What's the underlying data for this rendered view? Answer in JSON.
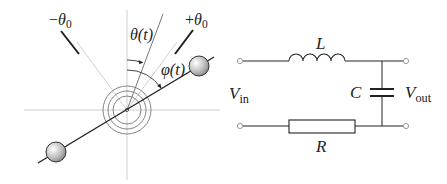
{
  "pendulum": {
    "labels": {
      "minus_theta0": {
        "sign": "−",
        "sym": "θ",
        "sub": "0"
      },
      "plus_theta0": {
        "sign": "+",
        "sym": "θ",
        "sub": "0"
      },
      "theta_t": "θ(t)",
      "phi_t": "φ(t)"
    }
  },
  "circuit": {
    "labels": {
      "inductor": "L",
      "capacitor": "C",
      "resistor": "R",
      "vin": {
        "sym": "V",
        "sub": "in"
      },
      "vout": {
        "sym": "V",
        "sub": "out"
      }
    }
  },
  "colors": {
    "line": "#222222",
    "guide": "#bbbbbb",
    "ring": "#777777",
    "terminal": "#999999"
  }
}
